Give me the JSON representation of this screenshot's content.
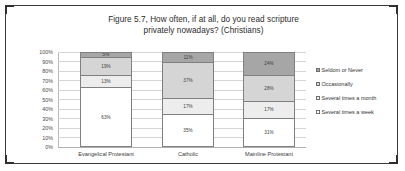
{
  "chart_data": {
    "type": "bar",
    "subtype": "stacked-100-percent",
    "title": "Figure 5.7, How often, if at all, do you read scripture privately nowadays? (Christians)",
    "title_line_1": "Figure 5.7, How often, if at all, do you read scripture",
    "title_line_2": "privately nowadays? (Christians)",
    "xlabel": "",
    "ylabel": "",
    "ylim": [
      0,
      100
    ],
    "ytick_labels": [
      "100%",
      "90%",
      "80%",
      "70%",
      "60%",
      "50%",
      "40%",
      "30%",
      "20%",
      "10%",
      "0%"
    ],
    "ytick_values": [
      100,
      90,
      80,
      70,
      60,
      50,
      40,
      30,
      20,
      10,
      0
    ],
    "grid": true,
    "legend_position": "right",
    "categories": [
      "Evangelical Protestant",
      "Catholic",
      "Mainline Protestant"
    ],
    "series": [
      {
        "name": "Seldom or Never",
        "color": "#a6a6a6",
        "values": [
          5,
          11,
          24
        ],
        "labels": [
          "5%",
          "11%",
          "24%"
        ]
      },
      {
        "name": "Occasionally",
        "color": "#d5d5d5",
        "values": [
          19,
          37,
          28
        ],
        "labels": [
          "19%",
          "37%",
          "28%"
        ]
      },
      {
        "name": "Several times a month",
        "color": "#ededed",
        "values": [
          13,
          17,
          17
        ],
        "labels": [
          "13%",
          "17%",
          "17%"
        ]
      },
      {
        "name": "Several times a week",
        "color": "#ffffff",
        "values": [
          63,
          35,
          31
        ],
        "labels": [
          "63%",
          "35%",
          "31%"
        ]
      }
    ],
    "stack_order_top_to_bottom": [
      "Seldom or Never",
      "Occasionally",
      "Several times a month",
      "Several times a week"
    ]
  },
  "legend": {
    "items": [
      {
        "label": "Seldom or Never"
      },
      {
        "label": "Occasionally"
      },
      {
        "label": "Several times a month"
      },
      {
        "label": "Several times a week"
      }
    ]
  }
}
